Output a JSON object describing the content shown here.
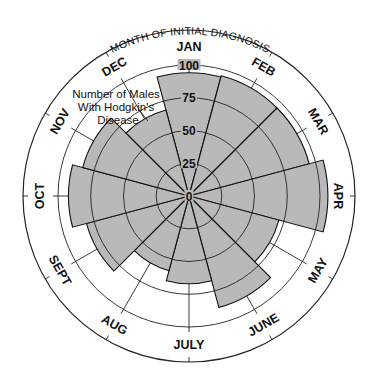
{
  "chart_data": {
    "type": "polar-area",
    "title": "MONTH OF INITIAL DIAGNOSIS",
    "series_label": [
      "Number of Males",
      "With Hodgkin's",
      "Disease"
    ],
    "categories": [
      "JAN",
      "FEB",
      "MAR",
      "APR",
      "MAY",
      "JUNE",
      "JULY",
      "AUG",
      "SEPT",
      "OCT",
      "NOV",
      "DEC"
    ],
    "values": [
      94,
      95,
      95,
      106,
      71,
      88,
      67,
      59,
      81,
      92,
      84,
      68
    ],
    "radial_ticks": [
      "0",
      "25",
      "50",
      "75",
      "100"
    ],
    "radial_range": [
      0,
      100
    ],
    "grid": true
  },
  "colors": {
    "wedge_fill": "#b9b9b9",
    "line": "#111111",
    "background": "#ffffff"
  }
}
